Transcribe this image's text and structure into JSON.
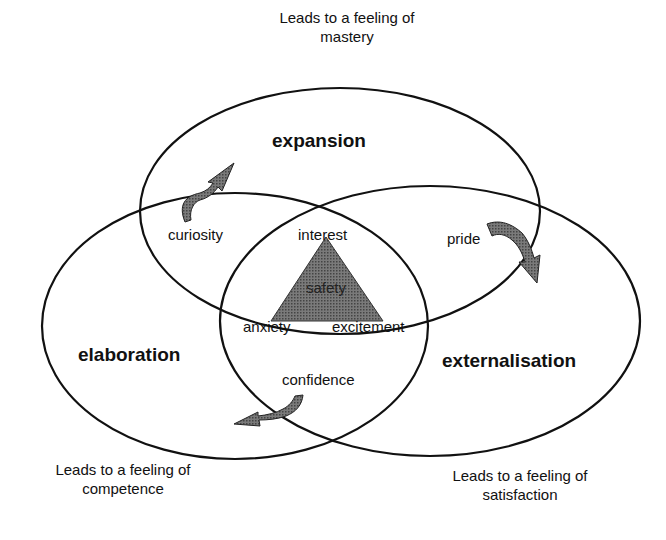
{
  "diagram": {
    "type": "venn-three-ellipses",
    "circles": [
      {
        "id": "expansion",
        "label": "expansion",
        "caption": [
          "Leads to a feeling of",
          "mastery"
        ]
      },
      {
        "id": "elaboration",
        "label": "elaboration",
        "caption": [
          "Leads to a feeling of",
          "competence"
        ]
      },
      {
        "id": "externalisation",
        "label": "externalisation",
        "caption": [
          "Leads to a feeling of",
          "satisfaction"
        ]
      }
    ],
    "overlaps": {
      "expansion_elaboration": "curiosity",
      "expansion_externalisation": "pride",
      "elaboration_externalisation": "confidence",
      "center_top": "interest",
      "center_left": "anxiety",
      "center_right": "excitement",
      "core": "safety"
    },
    "arrows": [
      "curiosity-arrow",
      "pride-arrow",
      "confidence-arrow"
    ],
    "colors": {
      "stroke": "#111111",
      "fill": "#6a6a6a",
      "background": "#ffffff"
    }
  }
}
